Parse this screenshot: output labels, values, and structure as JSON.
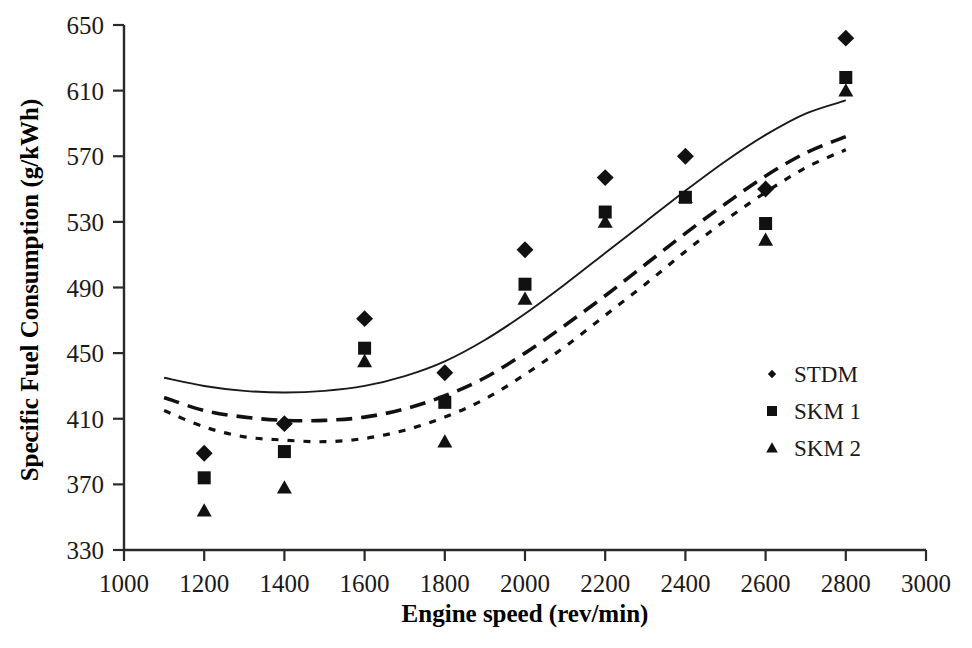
{
  "chart_data": {
    "type": "scatter",
    "title": "",
    "xlabel": "Engine speed (rev/min)",
    "ylabel": "Specific Fuel Consumption (g/kWh)",
    "xlim": [
      1000,
      3000
    ],
    "ylim": [
      330,
      650
    ],
    "xticks": [
      1000,
      1200,
      1400,
      1600,
      1800,
      2000,
      2200,
      2400,
      2600,
      2800,
      3000
    ],
    "yticks": [
      330,
      370,
      410,
      450,
      490,
      530,
      570,
      610,
      650
    ],
    "xtick_labels": [
      "1000",
      "1200",
      "1400",
      "1600",
      "1800",
      "2000",
      "2200",
      "2400",
      "2600",
      "2800",
      "3000"
    ],
    "ytick_labels": [
      "330",
      "370",
      "410",
      "450",
      "490",
      "530",
      "570",
      "610",
      "650"
    ],
    "grid": false,
    "legend_position": "right-middle",
    "x": [
      1200,
      1400,
      1600,
      1800,
      2000,
      2200,
      2400,
      2600,
      2800
    ],
    "series": [
      {
        "name": "STDM",
        "marker": "diamond",
        "values": [
          389,
          407,
          471,
          438,
          513,
          557,
          570,
          550,
          642
        ],
        "trend": {
          "style": "solid",
          "x": [
            1100,
            1200,
            1300,
            1400,
            1500,
            1600,
            1700,
            1800,
            1900,
            2000,
            2100,
            2200,
            2300,
            2400,
            2500,
            2600,
            2700,
            2800
          ],
          "y": [
            435,
            430,
            427,
            426,
            427,
            430,
            436,
            445,
            458,
            474,
            492,
            511,
            530,
            549,
            567,
            583,
            596,
            604
          ]
        }
      },
      {
        "name": "SKM 1",
        "marker": "square",
        "values": [
          374,
          390,
          453,
          420,
          492,
          536,
          545,
          529,
          618
        ],
        "trend": {
          "style": "dashed",
          "x": [
            1100,
            1200,
            1300,
            1400,
            1500,
            1600,
            1700,
            1800,
            1900,
            2000,
            2100,
            2200,
            2300,
            2400,
            2500,
            2600,
            2700,
            2800
          ],
          "y": [
            423,
            415,
            411,
            409,
            409,
            411,
            416,
            424,
            435,
            450,
            467,
            485,
            504,
            523,
            541,
            558,
            572,
            582
          ]
        }
      },
      {
        "name": "SKM 2",
        "marker": "triangle",
        "values": [
          354,
          368,
          445,
          396,
          483,
          530,
          545,
          519,
          610
        ],
        "trend": {
          "style": "dotted",
          "x": [
            1100,
            1200,
            1300,
            1400,
            1500,
            1600,
            1700,
            1800,
            1900,
            2000,
            2100,
            2200,
            2300,
            2400,
            2500,
            2600,
            2700,
            2800
          ],
          "y": [
            415,
            405,
            399,
            397,
            396,
            398,
            403,
            411,
            422,
            437,
            454,
            473,
            492,
            512,
            531,
            548,
            563,
            574
          ]
        }
      }
    ]
  },
  "legend": {
    "items": [
      {
        "label": "STDM",
        "marker": "diamond"
      },
      {
        "label": "SKM 1",
        "marker": "square"
      },
      {
        "label": "SKM 2",
        "marker": "triangle"
      }
    ]
  },
  "axes": {
    "x_title": "Engine speed (rev/min)",
    "y_title": "Specific Fuel Consumption (g/kWh)"
  }
}
